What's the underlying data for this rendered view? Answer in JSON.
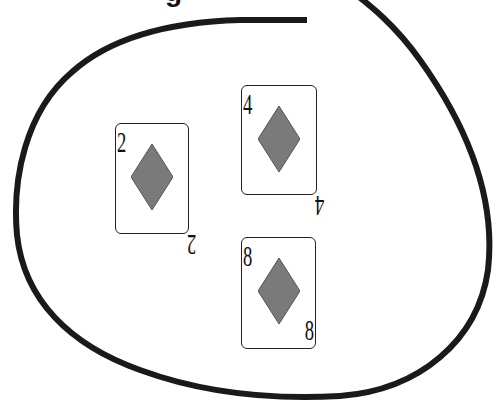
{
  "diagram": {
    "title_cropped": "g",
    "enclosure": {
      "shape": "closed-loop",
      "stroke": "#1a1a1a"
    },
    "cards": [
      {
        "rank": "2",
        "suit": "diamonds",
        "x": 115,
        "y": 123,
        "w": 74,
        "h": 111,
        "bottom_flipped": true
      },
      {
        "rank": "4",
        "suit": "diamonds",
        "x": 241,
        "y": 85,
        "w": 76,
        "h": 110,
        "bottom_flipped": true
      },
      {
        "rank": "8",
        "suit": "diamonds",
        "x": 241,
        "y": 237,
        "w": 75,
        "h": 112,
        "bottom_flipped": false
      }
    ],
    "suit_color": "#7a7a7a"
  }
}
